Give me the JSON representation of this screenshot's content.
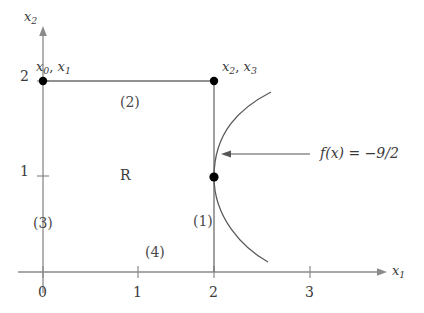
{
  "figure": {
    "background_color": "#ffffff",
    "axis_color": "#808080",
    "boundary_color": "#6e6e6e",
    "curve_color": "#5a5a5a",
    "text_color": "#3a3a3a",
    "dot_color": "#000000"
  },
  "axes": {
    "x_axis": {
      "name": "x",
      "subscript": "1",
      "ticks": [
        "0",
        "1",
        "2",
        "3"
      ],
      "tick_values": [
        0,
        1,
        2,
        3
      ],
      "range": [
        0,
        3.55
      ]
    },
    "y_axis": {
      "name": "x",
      "subscript": "2",
      "ticks": [
        "1",
        "2"
      ],
      "tick_values": [
        1,
        2
      ],
      "range": [
        0,
        2.5
      ]
    }
  },
  "points": [
    {
      "label_base": "x",
      "label": "x₀, x₁",
      "sub_a": "0",
      "sub_b": "1",
      "x": 0,
      "y": 2
    },
    {
      "label_base": "x",
      "label": "x₂, x₃",
      "sub_a": "2",
      "sub_b": "3",
      "x": 2,
      "y": 2
    },
    {
      "label": "",
      "x": 2,
      "y": 1
    }
  ],
  "edges": [
    {
      "id": "edge-1",
      "label": "(1)",
      "x": 2.0,
      "y": 0.55
    },
    {
      "id": "edge-2",
      "label": "(2)",
      "x": 0.9,
      "y": 1.78
    },
    {
      "id": "edge-3",
      "label": "(3)",
      "x": 0.0,
      "y": 0.52
    },
    {
      "id": "edge-4",
      "label": "(4)",
      "x": 1.2,
      "y": 0.13
    }
  ],
  "region": {
    "label": "R",
    "x": 0.87,
    "y": 1.0
  },
  "annotation": {
    "label": "f(x)  =  −9/2",
    "function_text": "f(x)",
    "equals": "=",
    "value": "−9/2",
    "arrow_from_x": 310,
    "arrow_to_x": 221,
    "arrow_y": 154
  },
  "curve": {
    "description": "leftward-opening parabola through (2,1)",
    "vertex_x": 2.05,
    "vertex_y": 1.27,
    "top_end": [
      2.6,
      1.88
    ],
    "bottom_end": [
      2.58,
      0.11
    ]
  }
}
